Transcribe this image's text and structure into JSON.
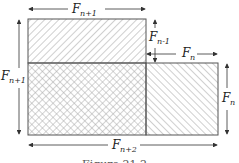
{
  "figure": {
    "labels": {
      "top_width": {
        "base": "F",
        "sub": "n+1"
      },
      "left_height": {
        "base": "F",
        "sub": "n+1"
      },
      "notch_height": {
        "base": "F",
        "sub": "n-1"
      },
      "right_width": {
        "base": "F",
        "sub": "n"
      },
      "right_height": {
        "base": "F",
        "sub": "n"
      },
      "bottom_width": {
        "base": "F",
        "sub": "n+2"
      }
    },
    "caption": "Figure 21.2",
    "colors": {
      "stroke": "#555555",
      "hatch": "#9a9a9a",
      "arrow": "#333333"
    }
  }
}
